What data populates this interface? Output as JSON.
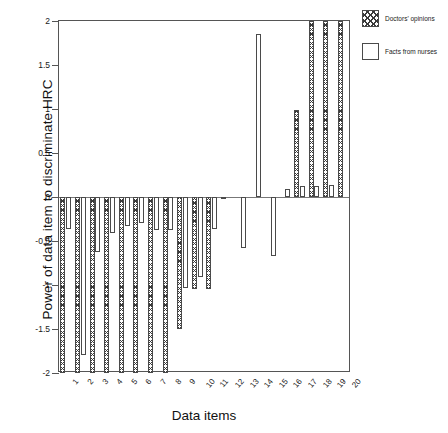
{
  "chart_data": {
    "type": "bar",
    "title": "",
    "xlabel": "Data items",
    "ylabel": "Power of data item to discriminate HRC",
    "ylim": [
      -2,
      2
    ],
    "yticks": [
      2,
      1.5,
      1,
      0.5,
      0,
      -0.5,
      -1,
      -1.5,
      -2
    ],
    "ytick_labels": [
      "2",
      "1.5",
      "1",
      "0.5",
      "0",
      "-0.5",
      "-1",
      "-1.5",
      "-2"
    ],
    "grid": false,
    "legend_position": "outside-top-right",
    "categories": [
      "1",
      "2",
      "3",
      "4",
      "5",
      "6",
      "7",
      "8",
      "9",
      "10",
      "11",
      "12",
      "13",
      "14",
      "15",
      "16",
      "17",
      "18",
      "19",
      "20"
    ],
    "series": [
      {
        "name": "Doctors' opinions",
        "pattern": "crosshatch",
        "color": "#3a3a3a",
        "values": [
          -2.0,
          -2.0,
          -2.0,
          -2.0,
          -2.0,
          -2.0,
          -2.0,
          -2.0,
          -1.5,
          -1.05,
          -1.05,
          -0.02,
          0.0,
          0.0,
          0.0,
          0.0,
          0.99,
          2.0,
          2.0,
          2.0
        ]
      },
      {
        "name": "Facts from nurses",
        "pattern": "solid-white",
        "color": "#ffffff",
        "values": [
          -0.36,
          -1.8,
          -0.62,
          -0.41,
          -0.33,
          -0.3,
          -0.37,
          -0.38,
          -1.03,
          -0.91,
          -0.36,
          0.0,
          -0.58,
          1.85,
          -0.67,
          0.09,
          0.12,
          0.13,
          0.14,
          0.0
        ]
      }
    ]
  },
  "legend": {
    "items": [
      {
        "label": "Doctors' opinions",
        "style": "doctors"
      },
      {
        "label": "Facts from nurses",
        "style": "nurses"
      }
    ]
  }
}
